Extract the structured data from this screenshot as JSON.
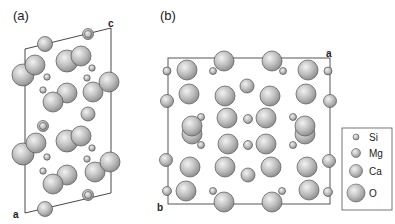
{
  "figure": {
    "panel_a": {
      "label": "(a)",
      "axes": {
        "top_right": "c",
        "bottom_left": "a"
      }
    },
    "panel_b": {
      "label": "(b)",
      "axes": {
        "top_right": "a",
        "bottom_left": "b"
      }
    },
    "legend": {
      "items": [
        {
          "label": "Si",
          "size": "smallest"
        },
        {
          "label": "Mg",
          "size": "small"
        },
        {
          "label": "Ca",
          "size": "medium"
        },
        {
          "label": "O",
          "size": "large"
        }
      ]
    }
  }
}
